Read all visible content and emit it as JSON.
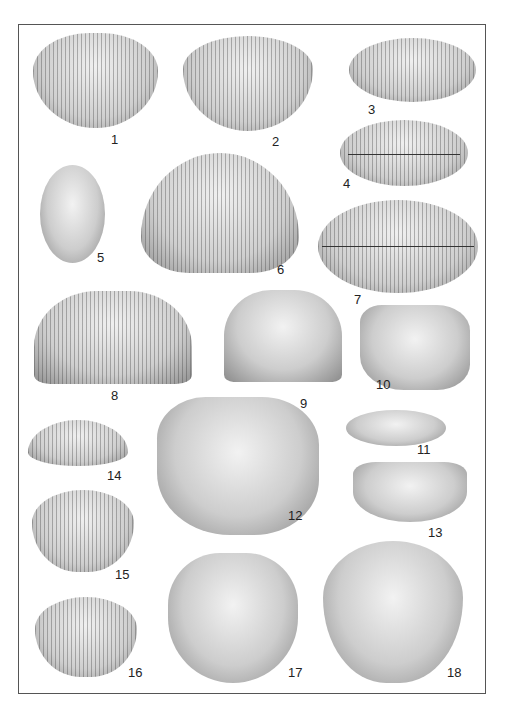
{
  "plate": {
    "specimens": [
      {
        "label": "1"
      },
      {
        "label": "2"
      },
      {
        "label": "3"
      },
      {
        "label": "4"
      },
      {
        "label": "5"
      },
      {
        "label": "6"
      },
      {
        "label": "7"
      },
      {
        "label": "8"
      },
      {
        "label": "9"
      },
      {
        "label": "10"
      },
      {
        "label": "11"
      },
      {
        "label": "12"
      },
      {
        "label": "13"
      },
      {
        "label": "14"
      },
      {
        "label": "15"
      },
      {
        "label": "16"
      },
      {
        "label": "17"
      },
      {
        "label": "18"
      }
    ],
    "caption": ""
  }
}
